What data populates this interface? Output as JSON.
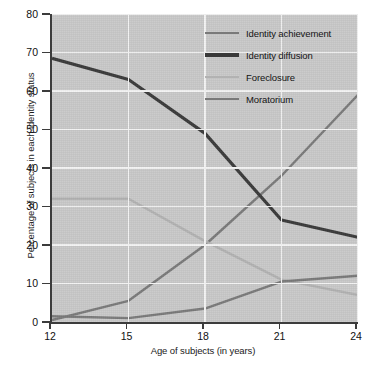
{
  "chart_data": {
    "type": "line",
    "title": "",
    "xlabel": "Age of subjects (in years)",
    "ylabel": "Percentage of subjects in each identity status",
    "x": [
      12,
      15,
      18,
      21,
      24
    ],
    "xtick_labels": [
      "12",
      "15",
      "18",
      "21",
      "24"
    ],
    "xlim": [
      12,
      24
    ],
    "ylim": [
      0,
      80
    ],
    "ytick_labels": [
      "0",
      "10",
      "20",
      "30",
      "40",
      "50",
      "60",
      "70",
      "80"
    ],
    "yticks": [
      0,
      10,
      20,
      30,
      40,
      50,
      60,
      70,
      80
    ],
    "grid": "horizontal-and-vertical-white",
    "legend_position": "top-right-inside",
    "plot_background": "#c9c9c9",
    "gridline_color": "#f4f4f4",
    "axis_color": "#3c3c3c",
    "series": [
      {
        "name": "Identity achievement",
        "color": "#7a7a7a",
        "width": 2.4,
        "values": [
          0.5,
          5.5,
          20.0,
          38.0,
          59.0
        ]
      },
      {
        "name": "Identity diffusion",
        "color": "#3a3a3a",
        "width": 3.2,
        "values": [
          68.5,
          63.0,
          49.0,
          26.5,
          22.0
        ]
      },
      {
        "name": "Foreclosure",
        "color": "#b2b2b2",
        "width": 2.4,
        "values": [
          32.0,
          32.0,
          21.0,
          11.0,
          7.0
        ]
      },
      {
        "name": "Moratorium",
        "color": "#7a7a7a",
        "width": 2.4,
        "values": [
          1.5,
          1.0,
          3.5,
          10.5,
          12.0
        ]
      }
    ]
  }
}
